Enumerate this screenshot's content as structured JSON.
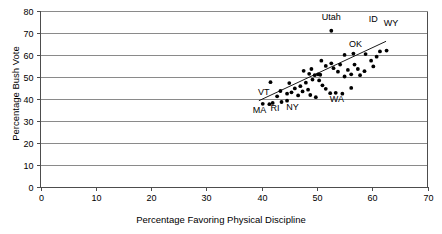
{
  "chart_data": {
    "type": "scatter",
    "title": "",
    "xlabel": "Percentage Favoring Physical Discipline",
    "ylabel": "Percentage Bush Vote",
    "xlim": [
      0,
      70
    ],
    "ylim": [
      0,
      80
    ],
    "xticks": [
      0,
      10,
      20,
      30,
      40,
      50,
      60,
      70
    ],
    "yticks": [
      0,
      10,
      20,
      30,
      40,
      50,
      60,
      70,
      80
    ],
    "grid": "horizontal",
    "legend": "none",
    "trend_line": {
      "x": [
        39.5,
        62.5
      ],
      "y": [
        39.0,
        66.0
      ]
    },
    "points": [
      {
        "x": 40.2,
        "y": 37.6,
        "label": "MA"
      },
      {
        "x": 41.4,
        "y": 37.4,
        "label": "RI"
      },
      {
        "x": 42.0,
        "y": 38.0,
        "label": "VT"
      },
      {
        "x": 43.6,
        "y": 38.4,
        "label": "NY"
      },
      {
        "x": 44.6,
        "y": 39.0,
        "label": ""
      },
      {
        "x": 42.8,
        "y": 41.0,
        "label": ""
      },
      {
        "x": 43.4,
        "y": 43.4,
        "label": ""
      },
      {
        "x": 44.6,
        "y": 42.2,
        "label": ""
      },
      {
        "x": 45.4,
        "y": 42.8,
        "label": ""
      },
      {
        "x": 46.0,
        "y": 44.6,
        "label": ""
      },
      {
        "x": 45.0,
        "y": 47.0,
        "label": ""
      },
      {
        "x": 41.6,
        "y": 47.4,
        "label": ""
      },
      {
        "x": 46.6,
        "y": 41.4,
        "label": ""
      },
      {
        "x": 47.4,
        "y": 43.2,
        "label": ""
      },
      {
        "x": 47.0,
        "y": 45.6,
        "label": ""
      },
      {
        "x": 48.0,
        "y": 47.2,
        "label": ""
      },
      {
        "x": 48.4,
        "y": 44.0,
        "label": ""
      },
      {
        "x": 48.8,
        "y": 41.6,
        "label": ""
      },
      {
        "x": 49.8,
        "y": 40.6,
        "label": ""
      },
      {
        "x": 49.2,
        "y": 48.6,
        "label": ""
      },
      {
        "x": 49.6,
        "y": 50.6,
        "label": ""
      },
      {
        "x": 48.6,
        "y": 51.2,
        "label": ""
      },
      {
        "x": 47.6,
        "y": 52.6,
        "label": ""
      },
      {
        "x": 49.0,
        "y": 53.4,
        "label": ""
      },
      {
        "x": 50.2,
        "y": 51.0,
        "label": ""
      },
      {
        "x": 50.6,
        "y": 50.8,
        "label": ""
      },
      {
        "x": 50.4,
        "y": 48.2,
        "label": ""
      },
      {
        "x": 51.0,
        "y": 46.0,
        "label": ""
      },
      {
        "x": 51.6,
        "y": 44.4,
        "label": ""
      },
      {
        "x": 52.4,
        "y": 42.4,
        "label": ""
      },
      {
        "x": 53.4,
        "y": 42.6,
        "label": "WA"
      },
      {
        "x": 54.6,
        "y": 42.2,
        "label": ""
      },
      {
        "x": 56.2,
        "y": 44.8,
        "label": ""
      },
      {
        "x": 51.6,
        "y": 54.8,
        "label": ""
      },
      {
        "x": 50.8,
        "y": 57.2,
        "label": ""
      },
      {
        "x": 52.6,
        "y": 56.0,
        "label": ""
      },
      {
        "x": 53.0,
        "y": 53.8,
        "label": ""
      },
      {
        "x": 53.8,
        "y": 52.2,
        "label": ""
      },
      {
        "x": 54.2,
        "y": 55.4,
        "label": ""
      },
      {
        "x": 55.0,
        "y": 50.0,
        "label": ""
      },
      {
        "x": 55.6,
        "y": 53.0,
        "label": ""
      },
      {
        "x": 56.2,
        "y": 51.0,
        "label": ""
      },
      {
        "x": 56.8,
        "y": 55.4,
        "label": ""
      },
      {
        "x": 57.4,
        "y": 53.4,
        "label": ""
      },
      {
        "x": 57.8,
        "y": 50.6,
        "label": ""
      },
      {
        "x": 58.6,
        "y": 52.4,
        "label": ""
      },
      {
        "x": 55.0,
        "y": 59.8,
        "label": ""
      },
      {
        "x": 56.6,
        "y": 60.4,
        "label": ""
      },
      {
        "x": 58.8,
        "y": 60.2,
        "label": "OK"
      },
      {
        "x": 59.8,
        "y": 57.2,
        "label": ""
      },
      {
        "x": 60.2,
        "y": 54.6,
        "label": ""
      },
      {
        "x": 60.8,
        "y": 59.0,
        "label": ""
      },
      {
        "x": 61.4,
        "y": 61.4,
        "label": "ID"
      },
      {
        "x": 62.6,
        "y": 61.8,
        "label": "WY"
      },
      {
        "x": 52.6,
        "y": 70.8,
        "label": "Utah"
      }
    ],
    "labels": [
      {
        "text": "Utah",
        "x": 52.6,
        "y": 75.5
      },
      {
        "text": "ID",
        "x": 60.2,
        "y": 74.6
      },
      {
        "text": "WY",
        "x": 63.4,
        "y": 73.0
      },
      {
        "text": "OK",
        "x": 57.0,
        "y": 63.2
      },
      {
        "text": "WA",
        "x": 53.6,
        "y": 38.6
      },
      {
        "text": "VT",
        "x": 40.4,
        "y": 41.4
      },
      {
        "text": "MA",
        "x": 39.6,
        "y": 33.6
      },
      {
        "text": "RI",
        "x": 42.4,
        "y": 34.4
      },
      {
        "text": "NY",
        "x": 45.6,
        "y": 35.0
      }
    ]
  },
  "axes": {
    "x_title": "Percentage Favoring Physical Discipline",
    "y_title": "Percentage Bush Vote",
    "x_tick_labels": [
      "0",
      "10",
      "20",
      "30",
      "40",
      "50",
      "60",
      "70"
    ],
    "y_tick_labels": [
      "0",
      "10",
      "20",
      "30",
      "40",
      "50",
      "60",
      "70",
      "80"
    ]
  },
  "colors": {
    "background": "#ffffff",
    "point": "#000000",
    "grid": "#8a8a8a",
    "axis": "#4d4d4d",
    "trend": "#1a1a1a",
    "text": "#000000"
  }
}
